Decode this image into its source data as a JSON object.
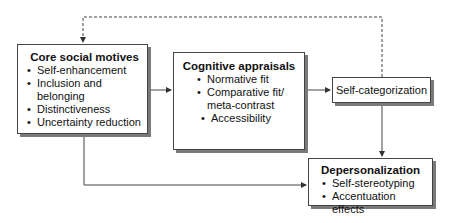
{
  "diagram": {
    "nodes": {
      "core": {
        "title": "Core social motives",
        "items": [
          "Self-enhancement",
          "Inclusion and",
          "belonging",
          "Distinctiveness",
          "Uncertainty reduction"
        ]
      },
      "cognitive": {
        "title": "Cognitive appraisals",
        "items": [
          "Normative fit",
          "Comparative fit/",
          "meta-contrast",
          "Accessibility"
        ]
      },
      "selfcat": {
        "title": "Self-categorization"
      },
      "depers": {
        "title": "Depersonalization",
        "items": [
          "Self-stereotyping",
          "Accentuation effects"
        ]
      }
    },
    "edges": [
      {
        "from": "Core social motives",
        "to": "Cognitive appraisals",
        "style": "solid"
      },
      {
        "from": "Cognitive appraisals",
        "to": "Self-categorization",
        "style": "solid"
      },
      {
        "from": "Self-categorization",
        "to": "Depersonalization",
        "style": "solid"
      },
      {
        "from": "Core social motives",
        "to": "Depersonalization",
        "style": "solid"
      },
      {
        "from": "Self-categorization",
        "to": "Core social motives",
        "style": "dashed"
      }
    ],
    "colors": {
      "line": "#444444",
      "shadow": "#7a7a7a",
      "box_fill": "#ffffff"
    }
  }
}
